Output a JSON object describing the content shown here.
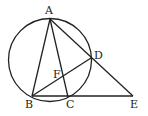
{
  "diagram": {
    "type": "geometry",
    "circle": {
      "cx": 50,
      "cy": 60,
      "r": 41.5
    },
    "points": {
      "A": {
        "x": 50,
        "y": 19,
        "label": "A",
        "lx": 45,
        "ly": 14
      },
      "B": {
        "x": 32,
        "y": 96,
        "label": "B",
        "lx": 25,
        "ly": 108
      },
      "C": {
        "x": 68,
        "y": 97,
        "label": "C",
        "lx": 66,
        "ly": 108
      },
      "D": {
        "x": 91,
        "y": 58,
        "label": "D",
        "lx": 94,
        "ly": 59
      },
      "E": {
        "x": 133,
        "y": 96,
        "label": "E",
        "lx": 130,
        "ly": 108
      },
      "F": {
        "x": 62,
        "y": 76,
        "label": "F",
        "lx": 53,
        "ly": 78
      }
    },
    "segments": [
      [
        "A",
        "B"
      ],
      [
        "A",
        "C"
      ],
      [
        "A",
        "E"
      ],
      [
        "B",
        "D"
      ],
      [
        "B",
        "E"
      ]
    ]
  }
}
